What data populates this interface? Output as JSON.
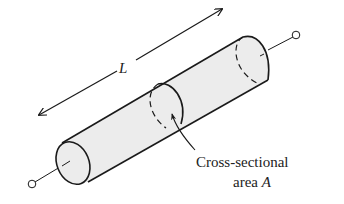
{
  "diagram": {
    "length_label": "L",
    "area_label_line1": "Cross-sectional",
    "area_label_line2_prefix": "area ",
    "area_label_symbol": "A",
    "colors": {
      "stroke": "#1a1a1a",
      "fill": "#ececec",
      "background": "#ffffff"
    },
    "elements": [
      "cylinder-body",
      "left-terminal",
      "right-terminal",
      "length-arrow",
      "cross-section",
      "area-pointer-arrow"
    ]
  }
}
